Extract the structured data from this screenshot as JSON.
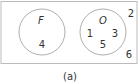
{
  "diagram": {
    "type": "venn",
    "universe_elements": [
      "2",
      "6"
    ],
    "sets": [
      {
        "name": "F",
        "elements": [
          "4"
        ]
      },
      {
        "name": "O",
        "elements": [
          "1",
          "3",
          "5"
        ]
      }
    ],
    "caption": "(a)"
  }
}
